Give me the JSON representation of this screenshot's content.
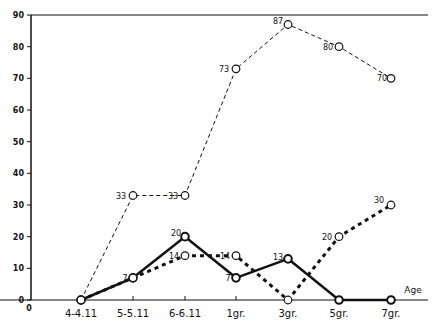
{
  "chart_data": {
    "type": "line",
    "title": "",
    "xlabel": "Age",
    "ylabel": "",
    "ylim": [
      0,
      90
    ],
    "yticks": [
      0,
      10,
      20,
      30,
      40,
      50,
      60,
      70,
      80,
      90
    ],
    "origin_label": "0",
    "grid": false,
    "legend": null,
    "categories": [
      "4-4.11",
      "5-5.11",
      "6-6.11",
      "1gr.",
      "3gr.",
      "5gr.",
      "7gr."
    ],
    "series": [
      {
        "name": "series-thin-dashed",
        "style": "thin-dashed",
        "values": [
          0,
          33,
          33,
          73,
          87,
          80,
          70
        ],
        "labels": [
          null,
          "33",
          "33",
          "73",
          "87",
          "80",
          "70"
        ]
      },
      {
        "name": "series-solid",
        "style": "solid-thick",
        "values": [
          0,
          7,
          20,
          7,
          13,
          0,
          0
        ],
        "labels": [
          null,
          "7",
          "20",
          "7",
          "13",
          null,
          null
        ]
      },
      {
        "name": "series-heavy-dotted",
        "style": "heavy-dotted",
        "values": [
          0,
          7,
          14,
          14,
          0,
          20,
          30
        ],
        "labels": [
          null,
          null,
          "14",
          "14",
          null,
          "20",
          "30"
        ]
      }
    ]
  },
  "colors": {
    "ink": "#111111",
    "background": "#ffffff"
  }
}
